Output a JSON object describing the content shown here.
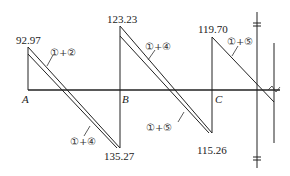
{
  "diagram": {
    "type": "bending-moment-envelope",
    "points": [
      {
        "label": "A",
        "x": 28
      },
      {
        "label": "B",
        "x": 120
      },
      {
        "label": "C",
        "x": 212
      }
    ],
    "values": {
      "a_top": "92.97",
      "b_top": "123.23",
      "c_top": "119.70",
      "ab_bottom": "135.27",
      "bc_bottom": "115.26"
    },
    "combos": {
      "ab_top": "①+②",
      "ab_bottom": "①+④",
      "bc_top": "①+④",
      "bc_bottom": "①+⑤",
      "c_right": "①+⑤"
    }
  }
}
